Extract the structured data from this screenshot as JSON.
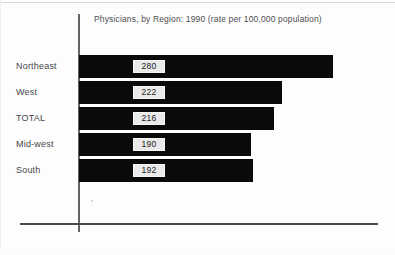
{
  "chart_data": {
    "type": "bar",
    "orientation": "horizontal",
    "title": "Physicians, by Region: 1990 (rate per 100,000 population)",
    "xlabel": "",
    "ylabel": "",
    "categories": [
      "Northeast",
      "West",
      "TOTAL",
      "Mid-west",
      "South"
    ],
    "values": [
      280,
      222,
      216,
      190,
      192
    ],
    "value_labels": [
      "280",
      "222",
      "216",
      "190",
      "192"
    ],
    "xlim": [
      0,
      325
    ],
    "grid": false,
    "legend": null,
    "bar_color": "#0a0a0a",
    "value_box_color": "#e9e9e9",
    "axis_color": "#4a4a4e",
    "background_color": "#fdfdfd",
    "series": [
      {
        "name": "Physicians per 100,000 population",
        "values": [
          280,
          222,
          216,
          190,
          192
        ]
      }
    ],
    "points": [
      {
        "category": "Northeast",
        "value": 280,
        "label": "280"
      },
      {
        "category": "West",
        "value": 222,
        "label": "222"
      },
      {
        "category": "TOTAL",
        "value": 216,
        "label": "216"
      },
      {
        "category": "Mid-west",
        "value": 190,
        "label": "190"
      },
      {
        "category": "South",
        "value": 192,
        "label": "192"
      }
    ]
  },
  "chart": {
    "title": "Physicians, by Region: 1990 (rate per 100,000 population)",
    "rows": [
      {
        "label": "Northeast",
        "value": "280",
        "bar_px": 254,
        "top_px": 55
      },
      {
        "label": "West",
        "value": "222",
        "bar_px": 203,
        "top_px": 81
      },
      {
        "label": "TOTAL",
        "value": "216",
        "bar_px": 195,
        "top_px": 107
      },
      {
        "label": "Mid-west",
        "value": "190",
        "bar_px": 172,
        "top_px": 133
      },
      {
        "label": "South",
        "value": "192",
        "bar_px": 174,
        "top_px": 159
      }
    ]
  }
}
